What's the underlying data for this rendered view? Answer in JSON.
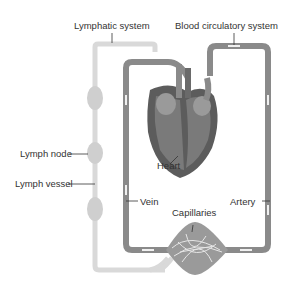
{
  "diagram": {
    "labels": {
      "lymphatic_system": "Lymphatic system",
      "blood_circulatory_system": "Blood circulatory system",
      "lymph_node": "Lymph node",
      "lymph_vessel": "Lymph vessel",
      "heart": "Heart",
      "vein": "Vein",
      "artery": "Artery",
      "capillaries": "Capillaries"
    },
    "colors": {
      "lymph": "#d9d9d9",
      "lymph_node": "#cfcfcf",
      "vessel": "#8a8a8a",
      "heart_dark": "#5c5c5c",
      "heart_mid": "#7a7a7a",
      "heart_light": "#9a9a9a",
      "arrow": "#f0f0f0",
      "text": "#333333"
    }
  }
}
